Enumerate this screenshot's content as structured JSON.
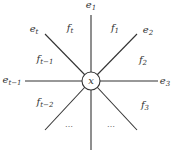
{
  "diagram": {
    "center_node": {
      "label": "x",
      "cx": 91,
      "cy": 81,
      "r": 9
    },
    "stroke_color": "#333333",
    "edges": [
      {
        "name": "edge-e1",
        "x1": 91,
        "y1": 72,
        "x2": 91,
        "y2": 15
      },
      {
        "name": "edge-e2",
        "x1": 97,
        "y1": 75,
        "x2": 137,
        "y2": 34
      },
      {
        "name": "edge-e3",
        "x1": 100,
        "y1": 81,
        "x2": 158,
        "y2": 81
      },
      {
        "name": "edge-lower-right",
        "x1": 97,
        "y1": 87,
        "x2": 137,
        "y2": 130
      },
      {
        "name": "edge-down",
        "x1": 91,
        "y1": 90,
        "x2": 91,
        "y2": 150
      },
      {
        "name": "edge-lower-left",
        "x1": 85,
        "y1": 87,
        "x2": 45,
        "y2": 130
      },
      {
        "name": "edge-e-t-minus-1",
        "x1": 82,
        "y1": 81,
        "x2": 25,
        "y2": 81
      },
      {
        "name": "edge-e-t",
        "x1": 85,
        "y1": 75,
        "x2": 45,
        "y2": 34
      }
    ],
    "edge_labels": [
      {
        "name": "label-e1",
        "base": "e",
        "sub": "1",
        "x": 91,
        "y": 6
      },
      {
        "name": "label-e2",
        "base": "e",
        "sub": "2",
        "x": 148,
        "y": 31
      },
      {
        "name": "label-e3",
        "base": "e",
        "sub": "3",
        "x": 165,
        "y": 82
      },
      {
        "name": "label-e-t-minus-1",
        "base": "e",
        "sub": "t−1",
        "x": 12,
        "y": 81
      },
      {
        "name": "label-e-t",
        "base": "e",
        "sub": "t",
        "x": 34,
        "y": 30
      }
    ],
    "face_labels": [
      {
        "name": "label-f-t",
        "base": "f",
        "sub": "t",
        "x": 70,
        "y": 29
      },
      {
        "name": "label-f1",
        "base": "f",
        "sub": "1",
        "x": 115,
        "y": 29
      },
      {
        "name": "label-f2",
        "base": "f",
        "sub": "2",
        "x": 143,
        "y": 61
      },
      {
        "name": "label-f3",
        "base": "f",
        "sub": "3",
        "x": 145,
        "y": 106
      },
      {
        "name": "label-f-t-minus-1",
        "base": "f",
        "sub": "t−1",
        "x": 45,
        "y": 60
      },
      {
        "name": "label-f-t-minus-2",
        "base": "f",
        "sub": "t−2",
        "x": 45,
        "y": 103
      }
    ],
    "ellipses": [
      {
        "name": "ellipsis-left",
        "text": "⋯",
        "x": 69,
        "y": 126
      },
      {
        "name": "ellipsis-right",
        "text": "⋯",
        "x": 111,
        "y": 126
      }
    ]
  }
}
